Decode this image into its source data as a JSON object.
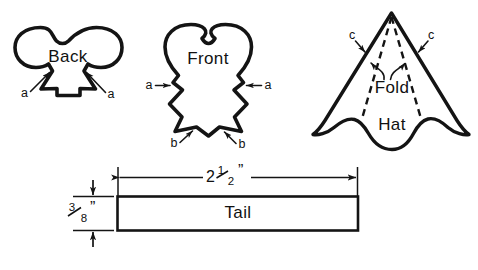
{
  "figure": {
    "ink_color": "#141414",
    "background": "#ffffff",
    "pieces": [
      {
        "id": "back",
        "label": "Back",
        "markers": [
          {
            "id": "back-a-left",
            "label": "a"
          },
          {
            "id": "back-a-right",
            "label": "a"
          }
        ]
      },
      {
        "id": "front",
        "label": "Front",
        "markers": [
          {
            "id": "front-a-left",
            "label": "a"
          },
          {
            "id": "front-a-right",
            "label": "a"
          },
          {
            "id": "front-b-left",
            "label": "b"
          },
          {
            "id": "front-b-right",
            "label": "b"
          }
        ]
      },
      {
        "id": "hat",
        "label": "Hat",
        "fold_label": "Fold",
        "markers": [
          {
            "id": "hat-c-left",
            "label": "c"
          },
          {
            "id": "hat-c-right",
            "label": "c"
          }
        ]
      },
      {
        "id": "tail",
        "label": "Tail",
        "dimensions": {
          "length": "2½”",
          "length_whole": "2",
          "length_fraction_numerator": "1",
          "length_fraction_denominator": "2",
          "length_unit": "”",
          "width_numerator": "3",
          "width_denominator": "8",
          "width_unit": "”"
        }
      }
    ],
    "caption": ""
  }
}
